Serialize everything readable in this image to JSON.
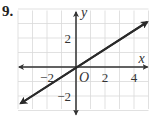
{
  "problem": {
    "number": "9."
  },
  "chart_data": {
    "type": "line",
    "title": "",
    "xlabel": "x",
    "ylabel": "y",
    "origin_label": "O",
    "xlim": [
      -4,
      5
    ],
    "ylim": [
      -3,
      4
    ],
    "grid": true,
    "x_ticks": [
      {
        "value": -2,
        "label": "−2"
      },
      {
        "value": 2,
        "label": "2"
      },
      {
        "value": 4,
        "label": "4"
      }
    ],
    "y_ticks": [
      {
        "value": 2,
        "label": "2"
      },
      {
        "value": -2,
        "label": "−2"
      }
    ],
    "series": [
      {
        "name": "line",
        "equation": "y = (2/3)x",
        "slope": 0.6667,
        "intercept": 0,
        "x": [
          -3.8,
          4.9
        ],
        "y": [
          -2.5,
          3.1
        ],
        "arrows": "both"
      }
    ],
    "colors": {
      "grid": "#d9d9d9",
      "axis": "#333333",
      "line": "#2a2a2a"
    }
  }
}
